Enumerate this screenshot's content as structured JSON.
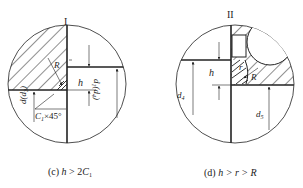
{
  "figure_left": {
    "roman_label": "I",
    "caption_prefix": "(c) ",
    "caption_var": "h",
    "caption_rest": " > 2",
    "caption_c": "C",
    "caption_sub": "1",
    "labels": {
      "R": "R",
      "h": "h",
      "d": "d(d",
      "d_sub": "3",
      "d_close": ")",
      "d1": "d",
      "d1_sub": "1",
      "d1_paren": "(d",
      "d1_paren_sub": "4",
      "d1_close": ")",
      "chamfer": "C",
      "chamfer_sub": "1",
      "chamfer_rest": "×45°"
    }
  },
  "figure_right": {
    "roman_label": "II",
    "caption_prefix": "(d) ",
    "caption_var": "h > r > R",
    "labels": {
      "r": "r",
      "R": "R",
      "h": "h",
      "d4": "d",
      "d4_sub": "4",
      "d5": "d",
      "d5_sub": "5"
    }
  },
  "colors": {
    "line": "#222222",
    "background": "#ffffff"
  }
}
